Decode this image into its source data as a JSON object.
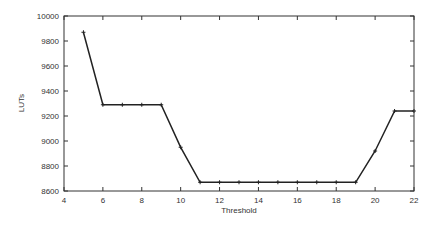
{
  "chart_data": {
    "type": "line",
    "title": "",
    "xlabel": "Threshold",
    "ylabel": "LUTs",
    "xlim": [
      4,
      22
    ],
    "ylim": [
      8600,
      10000
    ],
    "xticks": [
      4,
      6,
      8,
      10,
      12,
      14,
      16,
      18,
      20,
      22
    ],
    "yticks": [
      8600,
      8800,
      9000,
      9200,
      9400,
      9600,
      9800,
      10000
    ],
    "grid": false,
    "legend": null,
    "series": [
      {
        "name": "LUTs",
        "x": [
          5,
          6,
          7,
          8,
          9,
          10,
          11,
          12,
          13,
          14,
          15,
          16,
          17,
          18,
          19,
          20,
          21,
          22
        ],
        "values": [
          9870,
          9290,
          9290,
          9290,
          9290,
          8950,
          8670,
          8670,
          8670,
          8670,
          8670,
          8670,
          8670,
          8670,
          8670,
          8920,
          9240,
          9240
        ],
        "color": "#222222",
        "marker": "plus"
      }
    ]
  },
  "colors": {
    "axis": "#333333",
    "line": "#222222",
    "background": "#ffffff"
  }
}
